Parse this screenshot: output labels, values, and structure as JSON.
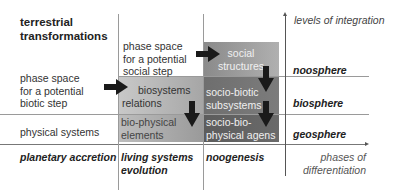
{
  "title": "terrestrial transformations",
  "title_lines": [
    "terrestrial",
    "transformations"
  ],
  "y_axis_label": "levels of integration",
  "x_axis_label_lines": [
    "phases of",
    "differentiation"
  ],
  "rows": [
    {
      "left_label_lines": [
        "phase space",
        "for a potential",
        "biotic step"
      ],
      "sphere": "biosphere"
    },
    {
      "left_label": "physical systems",
      "sphere": "geosphere"
    }
  ],
  "top_sphere": "noosphere",
  "cells": {
    "social_step_lines": [
      "phase space",
      "for a potential",
      "social step"
    ],
    "social_structures_lines": [
      "social",
      "structures"
    ],
    "biosystems_relations_lines": [
      "biosystems",
      "relations"
    ],
    "socio_biotic_lines": [
      "socio-biotic",
      "subsystems"
    ],
    "bio_physical_lines": [
      "bio-physical",
      "elements"
    ],
    "socio_bio_physical_lines": [
      "socio-bio-",
      "physical agens"
    ]
  },
  "phases": {
    "planetary": "planetary accretion",
    "living_lines": [
      "living systems",
      "evolution"
    ],
    "noogenesis": "noogenesis"
  },
  "colors": {
    "light_shade": "#b5b5b5",
    "mid_shade": "#8c8c8c",
    "dark_shade": "#666666",
    "arrow": "#1a1a1a",
    "grid": "#9a9a9a"
  }
}
